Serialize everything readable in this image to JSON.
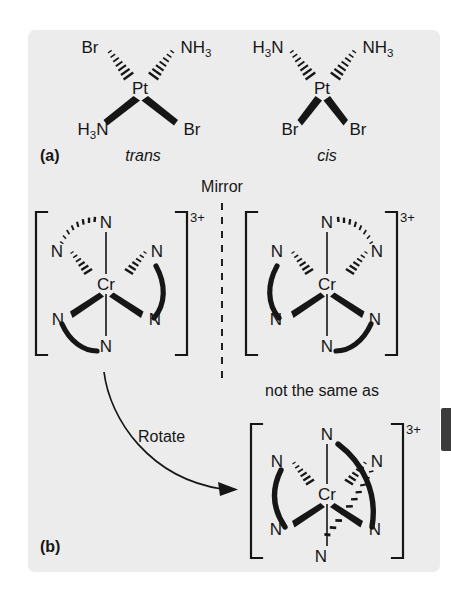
{
  "figure": {
    "background_color": "#ffffff",
    "panel_color": "#ececed",
    "ink_color": "#161616",
    "edge_tab_color": "#3c3c3c"
  },
  "part_a": {
    "caption": "(a)",
    "subject": "square planar platinum diammine dibromide geometric isomers",
    "molecules": [
      {
        "name": "trans isomer",
        "label": "trans",
        "center_atom": "Pt",
        "ligands": [
          {
            "position": "top-left",
            "text": "Br",
            "sub": "",
            "bond": "hashed"
          },
          {
            "position": "top-right",
            "text": "NH",
            "sub": "3",
            "bond": "hashed"
          },
          {
            "position": "bottom-left",
            "text": "H",
            "sub": "3",
            "text_tail": "N",
            "bond": "wedge"
          },
          {
            "position": "bottom-right",
            "text": "Br",
            "sub": "",
            "bond": "wedge"
          }
        ]
      },
      {
        "name": "cis isomer",
        "label": "cis",
        "center_atom": "Pt",
        "ligands": [
          {
            "position": "top-left",
            "text": "H",
            "sub": "3",
            "text_tail": "N",
            "bond": "hashed"
          },
          {
            "position": "top-right",
            "text": "NH",
            "sub": "3",
            "bond": "hashed"
          },
          {
            "position": "bottom-left",
            "text": "Br",
            "sub": "",
            "bond": "wedge"
          },
          {
            "position": "bottom-right",
            "text": "Br",
            "sub": "",
            "bond": "wedge"
          }
        ]
      }
    ]
  },
  "part_b": {
    "caption": "(b)",
    "mirror_label": "Mirror",
    "rotate_label": "Rotate",
    "not_same_label": "not the same as",
    "subject": "tris(ethylenediamine)chromium(III) enantiomers",
    "complexes": [
      {
        "name": "left enantiomer",
        "center_atom": "Cr",
        "charge": "3+",
        "donor_atom": "N",
        "donor_count": 6,
        "bracket": true
      },
      {
        "name": "right enantiomer (mirror image)",
        "center_atom": "Cr",
        "charge": "3+",
        "donor_atom": "N",
        "donor_count": 6,
        "bracket": true
      },
      {
        "name": "rotated left enantiomer",
        "center_atom": "Cr",
        "charge": "3+",
        "donor_atom": "N",
        "donor_count": 6,
        "bracket": true
      }
    ]
  }
}
